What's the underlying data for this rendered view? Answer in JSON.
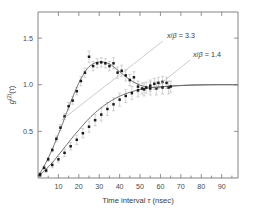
{
  "figure": {
    "title": "",
    "background_color": "#ffffff",
    "axis_color": "#767676",
    "curve_color": "#6e6e6e",
    "marker_color": "#1a1a1a",
    "errorbar_color": "#b0b0b0",
    "leader_color": "#b9b9b9"
  },
  "axes": {
    "x_title_parts": {
      "pre": "Time interval ",
      "symbol": "τ",
      "post": " (nsec)"
    },
    "x_title": "Time interval τ (nsec)",
    "y_title_parts": {
      "main": "g",
      "sup": "(2)",
      "arg": "(τ)"
    },
    "y_title": "g(2)(τ)",
    "x_ticklabels": [
      "10",
      "20",
      "30",
      "40",
      "50",
      "60",
      "70",
      "80",
      "90"
    ],
    "x_tickvalues": [
      10,
      20,
      30,
      40,
      50,
      60,
      70,
      80,
      90
    ],
    "y_ticklabels": [
      "0.5",
      "1.0",
      "1.5"
    ],
    "y_tickvalues": [
      0.5,
      1.0,
      1.5
    ]
  },
  "annotations": [
    {
      "id": "annot-upper",
      "text": "x/β = 3.3",
      "var": "x",
      "denom": "β",
      "value": "3.3",
      "x_px": 167,
      "y_px": 38
    },
    {
      "id": "annot-lower",
      "text": "x/β = 1.4",
      "var": "x",
      "denom": "β",
      "value": "1.4",
      "x_px": 193,
      "y_px": 57
    }
  ],
  "chart_data": {
    "type": "scatter",
    "title": "",
    "xlabel": "Time interval τ (nsec)",
    "ylabel": "g(2)(τ)",
    "xlim": [
      0,
      98
    ],
    "ylim": [
      0.0,
      1.78
    ],
    "grid": false,
    "legend_position": "inline-annotations",
    "series": [
      {
        "name": "x/β = 3.3",
        "marker": "square",
        "marker_color": "#1a1a1a",
        "line_color": "#6e6e6e",
        "x": [
          1.0,
          3.0,
          5.0,
          7.0,
          9.0,
          11.0,
          13.0,
          15.0,
          17.0,
          19.0,
          21.0,
          23.0,
          25.0,
          27.0,
          29.0,
          31.0,
          33.0,
          35.0,
          37.0,
          39.0,
          41.0,
          43.0,
          45.0,
          47.0,
          49.0,
          51.0,
          53.0,
          55.0,
          57.0,
          59.0,
          61.0,
          63.0,
          65.0
        ],
        "y": [
          0.04,
          0.11,
          0.2,
          0.3,
          0.42,
          0.54,
          0.66,
          0.77,
          0.83,
          0.93,
          1.04,
          1.13,
          1.3,
          1.2,
          1.23,
          1.24,
          1.23,
          1.2,
          1.23,
          1.13,
          1.15,
          1.1,
          1.05,
          1.08,
          0.98,
          0.96,
          0.97,
          0.99,
          1.01,
          1.02,
          1.03,
          1.02,
          0.98
        ],
        "yerr": [
          0.02,
          0.02,
          0.02,
          0.02,
          0.03,
          0.03,
          0.03,
          0.04,
          0.04,
          0.04,
          0.05,
          0.05,
          0.06,
          0.05,
          0.05,
          0.05,
          0.05,
          0.05,
          0.06,
          0.06,
          0.06,
          0.06,
          0.06,
          0.06,
          0.06,
          0.06,
          0.06,
          0.06,
          0.06,
          0.06,
          0.06,
          0.06,
          0.06
        ]
      },
      {
        "name": "x/β = 1.4",
        "marker": "square",
        "marker_color": "#1a1a1a",
        "line_color": "#6e6e6e",
        "x": [
          1.0,
          4.0,
          7.0,
          10.0,
          13.0,
          16.0,
          19.0,
          22.0,
          25.0,
          28.0,
          31.0,
          34.0,
          37.0,
          40.0,
          43.0,
          46.0,
          49.0,
          52.0,
          55.0,
          58.0,
          61.0,
          64.0
        ],
        "y": [
          0.03,
          0.08,
          0.14,
          0.2,
          0.27,
          0.34,
          0.41,
          0.48,
          0.55,
          0.62,
          0.68,
          0.74,
          0.79,
          0.84,
          0.88,
          0.91,
          0.94,
          0.95,
          0.96,
          0.96,
          0.97,
          0.97
        ],
        "yerr": [
          0.02,
          0.02,
          0.03,
          0.03,
          0.04,
          0.04,
          0.05,
          0.05,
          0.06,
          0.06,
          0.07,
          0.07,
          0.07,
          0.07,
          0.07,
          0.07,
          0.07,
          0.07,
          0.07,
          0.07,
          0.07,
          0.07
        ]
      }
    ],
    "fit_curves": [
      {
        "name": "fit x/β = 3.3",
        "x": [
          0,
          2,
          4,
          6,
          8,
          10,
          12,
          14,
          16,
          18,
          20,
          22,
          24,
          26,
          28,
          30,
          32,
          34,
          36,
          38,
          40,
          42,
          44,
          46,
          48,
          50,
          52,
          54,
          56,
          58,
          60,
          64,
          68,
          72,
          76,
          80,
          84,
          88,
          92,
          96,
          98
        ],
        "y": [
          0.02,
          0.09,
          0.17,
          0.26,
          0.36,
          0.47,
          0.58,
          0.7,
          0.81,
          0.92,
          1.02,
          1.1,
          1.17,
          1.21,
          1.235,
          1.245,
          1.243,
          1.232,
          1.21,
          1.175,
          1.14,
          1.105,
          1.07,
          1.04,
          1.015,
          0.995,
          0.982,
          0.975,
          0.972,
          0.973,
          0.976,
          0.983,
          0.99,
          0.995,
          0.998,
          1.0,
          1.001,
          1.001,
          1.001,
          1.0,
          1.0
        ]
      },
      {
        "name": "fit x/β = 1.4",
        "x": [
          0,
          2,
          4,
          6,
          8,
          10,
          12,
          14,
          16,
          18,
          20,
          22,
          24,
          26,
          28,
          30,
          32,
          34,
          36,
          38,
          40,
          42,
          44,
          46,
          48,
          50,
          54,
          58,
          62,
          66,
          70,
          74,
          78,
          82,
          86,
          90,
          94,
          98
        ],
        "y": [
          0.02,
          0.055,
          0.095,
          0.14,
          0.19,
          0.245,
          0.3,
          0.355,
          0.41,
          0.465,
          0.515,
          0.565,
          0.615,
          0.66,
          0.7,
          0.737,
          0.772,
          0.802,
          0.83,
          0.855,
          0.877,
          0.896,
          0.912,
          0.926,
          0.938,
          0.948,
          0.963,
          0.974,
          0.981,
          0.987,
          0.991,
          0.994,
          0.996,
          0.998,
          0.999,
          1.0,
          1.0,
          1.0
        ]
      }
    ]
  }
}
